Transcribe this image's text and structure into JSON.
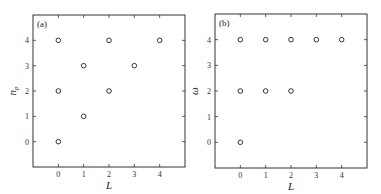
{
  "chart_data": [
    {
      "type": "scatter",
      "panel_label": "(a)",
      "title": "",
      "xlabel": "L",
      "ylabel": "n_p",
      "xticks": [
        0,
        1,
        2,
        3,
        4
      ],
      "yticks": [
        0,
        1,
        2,
        3,
        4
      ],
      "xlim": [
        -1,
        5
      ],
      "ylim": [
        -1,
        5
      ],
      "grid": false,
      "marker": "open-circle",
      "points": [
        {
          "x": 0,
          "y": 0
        },
        {
          "x": 0,
          "y": 2
        },
        {
          "x": 0,
          "y": 4
        },
        {
          "x": 1,
          "y": 1
        },
        {
          "x": 1,
          "y": 3
        },
        {
          "x": 2,
          "y": 2
        },
        {
          "x": 2,
          "y": 4
        },
        {
          "x": 3,
          "y": 3
        },
        {
          "x": 4,
          "y": 4
        }
      ]
    },
    {
      "type": "scatter",
      "panel_label": "(b)",
      "title": "",
      "xlabel": "L",
      "ylabel": "ω",
      "xticks": [
        0,
        1,
        2,
        3,
        4
      ],
      "yticks": [
        0,
        1,
        2,
        3,
        4
      ],
      "xlim": [
        -1,
        5
      ],
      "ylim": [
        -1,
        5
      ],
      "grid": false,
      "marker": "open-circle",
      "points": [
        {
          "x": 0,
          "y": 0
        },
        {
          "x": 0,
          "y": 2
        },
        {
          "x": 0,
          "y": 4
        },
        {
          "x": 1,
          "y": 2
        },
        {
          "x": 1,
          "y": 4
        },
        {
          "x": 2,
          "y": 2
        },
        {
          "x": 2,
          "y": 4
        },
        {
          "x": 3,
          "y": 4
        },
        {
          "x": 4,
          "y": 4
        }
      ]
    }
  ],
  "panels": {
    "a": {
      "tag": "(a)",
      "xlabel": "L",
      "ylabel_main": "n",
      "ylabel_sub": "p"
    },
    "b": {
      "tag": "(b)",
      "xlabel": "L",
      "ylabel_main": "ω"
    }
  }
}
